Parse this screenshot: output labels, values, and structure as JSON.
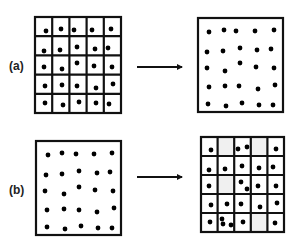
{
  "panels": [
    {
      "label": "(a)",
      "label_pos": [
        9,
        59
      ],
      "arrow": {
        "x1": 137,
        "x2": 183,
        "y": 67
      },
      "left": {
        "kind": "grid",
        "box": [
          35,
          17,
          121,
          113
        ],
        "rows": 5,
        "cols": 5,
        "shaded_cells": [],
        "dots": [
          [
            46,
            31
          ],
          [
            61,
            29
          ],
          [
            74,
            30
          ],
          [
            92,
            30
          ],
          [
            111,
            29
          ],
          [
            44,
            51
          ],
          [
            60,
            50
          ],
          [
            77,
            47
          ],
          [
            95,
            49
          ],
          [
            108,
            48
          ],
          [
            44,
            67
          ],
          [
            62,
            69
          ],
          [
            77,
            63
          ],
          [
            94,
            66
          ],
          [
            112,
            67
          ],
          [
            45,
            86
          ],
          [
            62,
            85
          ],
          [
            77,
            86
          ],
          [
            96,
            88
          ],
          [
            113,
            84
          ],
          [
            45,
            103
          ],
          [
            63,
            105
          ],
          [
            79,
            102
          ],
          [
            96,
            103
          ],
          [
            109,
            104
          ]
        ]
      },
      "right": {
        "kind": "box",
        "box": [
          198,
          18,
          283,
          112
        ],
        "dots": [
          [
            209,
            32
          ],
          [
            224,
            30
          ],
          [
            236,
            31
          ],
          [
            255,
            31
          ],
          [
            274,
            30
          ],
          [
            207,
            52
          ],
          [
            223,
            51
          ],
          [
            240,
            48
          ],
          [
            257,
            50
          ],
          [
            271,
            49
          ],
          [
            207,
            68
          ],
          [
            225,
            71
          ],
          [
            240,
            63
          ],
          [
            256,
            67
          ],
          [
            274,
            68
          ],
          [
            209,
            87
          ],
          [
            225,
            86
          ],
          [
            239,
            86
          ],
          [
            258,
            89
          ],
          [
            275,
            85
          ],
          [
            208,
            104
          ],
          [
            226,
            106
          ],
          [
            242,
            103
          ],
          [
            259,
            105
          ],
          [
            273,
            105
          ]
        ]
      }
    },
    {
      "label": "(b)",
      "label_pos": [
        9,
        183
      ],
      "arrow": {
        "x1": 137,
        "x2": 183,
        "y": 177
      },
      "left": {
        "kind": "box",
        "box": [
          36,
          141,
          121,
          235
        ],
        "dots": [
          [
            48,
            155
          ],
          [
            62,
            153
          ],
          [
            76,
            154
          ],
          [
            94,
            154
          ],
          [
            112,
            153
          ],
          [
            46,
            175
          ],
          [
            62,
            174
          ],
          [
            79,
            171
          ],
          [
            97,
            173
          ],
          [
            110,
            172
          ],
          [
            45,
            191
          ],
          [
            64,
            194
          ],
          [
            79,
            187
          ],
          [
            95,
            190
          ],
          [
            113,
            191
          ],
          [
            47,
            210
          ],
          [
            64,
            209
          ],
          [
            79,
            210
          ],
          [
            97,
            212
          ],
          [
            114,
            208
          ],
          [
            47,
            227
          ],
          [
            65,
            229
          ],
          [
            81,
            226
          ],
          [
            98,
            228
          ],
          [
            112,
            228
          ]
        ]
      },
      "right": {
        "kind": "grid",
        "box": [
          201,
          137,
          284,
          232
        ],
        "rows": 5,
        "cols": 5,
        "shaded_cells": [
          [
            0,
            1
          ],
          [
            0,
            3
          ],
          [
            2,
            1
          ],
          [
            4,
            3
          ]
        ],
        "dots": [
          [
            211,
            150
          ],
          [
            238,
            149
          ],
          [
            247,
            147
          ],
          [
            276,
            149
          ],
          [
            209,
            170
          ],
          [
            225,
            169
          ],
          [
            242,
            166
          ],
          [
            259,
            168
          ],
          [
            273,
            167
          ],
          [
            209,
            186
          ],
          [
            241,
            182
          ],
          [
            247,
            189
          ],
          [
            258,
            186
          ],
          [
            276,
            186
          ],
          [
            211,
            205
          ],
          [
            227,
            204
          ],
          [
            241,
            204
          ],
          [
            260,
            207
          ],
          [
            277,
            203
          ],
          [
            210,
            222
          ],
          [
            222,
            219
          ],
          [
            223,
            224
          ],
          [
            231,
            225
          ],
          [
            243,
            222
          ],
          [
            275,
            223
          ]
        ]
      }
    }
  ],
  "style": {
    "line_color": "#111111",
    "dot_color": "#000000",
    "shade_color": "#f0f0f0",
    "dot_radius": 2.4,
    "grid_stroke": 2.2,
    "box_stroke": 2.2
  }
}
